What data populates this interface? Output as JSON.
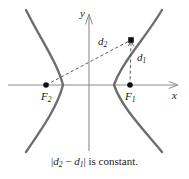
{
  "figure": {
    "kind": "hyperbola-definition-diagram",
    "caption_parts": {
      "bar_open": "|",
      "d2": "d",
      "d2_sub": "2",
      "minus": " − ",
      "d1": "d",
      "d1_sub": "1",
      "bar_close": "|",
      "tail": " is constant."
    },
    "caption_text": "|d2 − d1| is constant.",
    "axes": {
      "x_label": "x",
      "y_label": "y",
      "x_axis_y_px": 85,
      "y_axis_x_px": 89,
      "x_axis_from_px": 8,
      "x_axis_to_px": 180,
      "y_axis_from_px": 14,
      "y_axis_to_px": 151
    },
    "points": [
      {
        "id": "F2",
        "label": "F",
        "sub": "2",
        "x": 46,
        "y": 85,
        "label_dx": -4,
        "label_dy": 7
      },
      {
        "id": "F1",
        "label": "F",
        "sub": "1",
        "x": 130,
        "y": 85,
        "label_dx": -4,
        "label_dy": 7
      },
      {
        "id": "P",
        "label": "",
        "sub": "",
        "x": 131,
        "y": 40,
        "label_dx": 0,
        "label_dy": 0
      }
    ],
    "distances": [
      {
        "id": "d2",
        "label": "d",
        "sub": "2",
        "from": "F2",
        "to": "P",
        "label_x": 100,
        "label_y": 38
      },
      {
        "id": "d1",
        "label": "d",
        "sub": "1",
        "from": "F1",
        "to": "P",
        "label_x": 138,
        "label_y": 54
      }
    ],
    "colors": {
      "curve": "#6e6e6e",
      "axis": "#8c8c8c",
      "dashed": "#5a5a5a",
      "point": "#111111",
      "text": "#1a1a1a",
      "background": "#ffffff"
    },
    "geometry": {
      "vertex_left_px": 63,
      "vertex_right_px": 114,
      "branch_top_y_px": 10,
      "branch_bottom_y_px": 152
    }
  }
}
